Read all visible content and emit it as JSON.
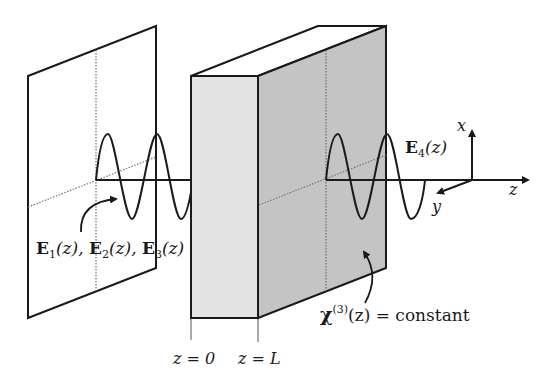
{
  "figure": {
    "type": "Nonlinear optics schematic: four-wave mixing in a slab with constant third-order susceptibility",
    "colors": {
      "line": "#1a1a1a",
      "front_face": "#e3e3e3",
      "side_face": "#c4c4c4",
      "top_face": "#ffffff",
      "dotted": "#555555"
    }
  },
  "labels": {
    "input_fields": {
      "E1": "E",
      "sub1": "1",
      "arg1": "(z), ",
      "E2": "E",
      "sub2": "2",
      "arg2": "(z), ",
      "E3": "E",
      "sub3": "3",
      "arg3": "(z)"
    },
    "output_field": {
      "E": "E",
      "sub": "4",
      "arg": "(z)"
    },
    "medium": {
      "chi": "χ",
      "sup": "(3)",
      "rest": "(z) = constant"
    },
    "z0": "z = 0",
    "zL": "z = L",
    "axes": {
      "x": "x",
      "y": "y",
      "z": "z"
    }
  }
}
